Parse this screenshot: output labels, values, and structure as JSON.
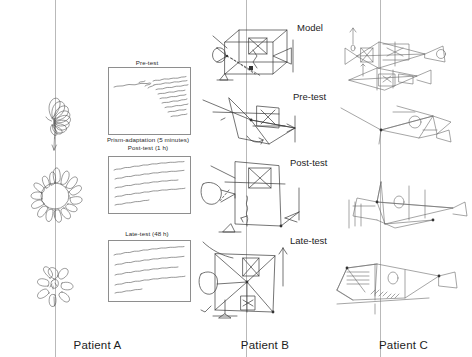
{
  "figure": {
    "type": "scientific-figure",
    "background": "#ffffff",
    "ink_color": "#3a3a3a",
    "rule_color": "#b9b9b9"
  },
  "columns": [
    {
      "id": "a",
      "patient_label": "Patient A",
      "task": "daisy-drawing"
    },
    {
      "id": "b",
      "patient_label": "Patient B",
      "task": "shape-copy-drawing"
    },
    {
      "id": "c",
      "patient_label": "Patient C",
      "task": "fish-copy-drawing"
    }
  ],
  "stage_labels": {
    "model": "Model",
    "pre_test": "Pre-test",
    "post_test": "Post-test",
    "late_test": "Late-test"
  },
  "timeline_labels": {
    "pre_test": "Pre-test",
    "prism_adaptation": "Prism-adaptation (5 minutes)",
    "post_test": "Post-test (1 h)",
    "late_test": "Late-test (48 h)"
  },
  "writing_samples": [
    {
      "stage": "Pre-test",
      "name": "handwriting-sample-pre",
      "lines": 7
    },
    {
      "stage": "Post-test",
      "name": "handwriting-sample-post",
      "lines": 4
    },
    {
      "stage": "Late-test",
      "name": "handwriting-sample-late",
      "lines": 4
    }
  ],
  "daisy_drawings": [
    {
      "stage": "Pre-test",
      "petals_left": 0,
      "petals_right": 9,
      "note": "petals only on right side"
    },
    {
      "stage": "Post-test",
      "petals_left": 9,
      "petals_right": 9,
      "note": "petals all around"
    },
    {
      "stage": "Late-test",
      "petals_left": 3,
      "petals_right": 4,
      "note": "petals mostly complete"
    }
  ]
}
